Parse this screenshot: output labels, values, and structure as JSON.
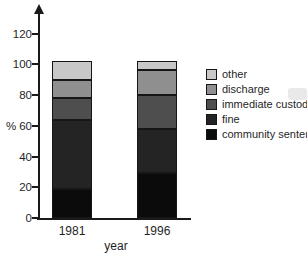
{
  "figure": {
    "background": "#ffffff",
    "axis_color": "#1a1a1a",
    "text_color": "#1f1f1f"
  },
  "chart_data": {
    "type": "bar",
    "stacked": true,
    "title": "",
    "categories": [
      "1981",
      "1996"
    ],
    "series": [
      {
        "name": "community sentence",
        "color": "#0b0b0b",
        "values": [
          19,
          29
        ]
      },
      {
        "name": "fine",
        "color": "#242424",
        "values": [
          45,
          29
        ]
      },
      {
        "name": "immediate custody",
        "color": "#4e4e4e",
        "values": [
          14,
          22
        ]
      },
      {
        "name": "discharge",
        "color": "#8f8f8f",
        "values": [
          12,
          16
        ]
      },
      {
        "name": "other",
        "color": "#c8c8c8",
        "values": [
          12,
          6
        ]
      }
    ],
    "xlabel": "year",
    "ylabel": "%",
    "yticks": [
      0,
      20,
      40,
      60,
      80,
      100,
      120
    ],
    "ylim": [
      0,
      128
    ],
    "grid": false,
    "legend_position": "right",
    "legend_order_top_to_bottom": [
      "other",
      "discharge",
      "immediate custody",
      "fine",
      "community sentence"
    ]
  }
}
